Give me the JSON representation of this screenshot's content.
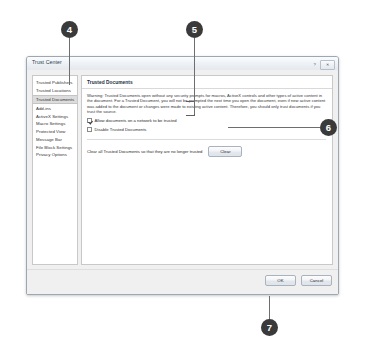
{
  "dialog": {
    "title": "Trust Center",
    "window_controls": [
      {
        "name": "help",
        "glyph": "?"
      },
      {
        "name": "close",
        "glyph": "✕"
      }
    ],
    "sidebar": {
      "items": [
        {
          "label": "Trusted Publishers",
          "selected": false
        },
        {
          "label": "Trusted Locations",
          "selected": false
        },
        {
          "label": "Trusted Documents",
          "selected": true
        },
        {
          "label": "Add-ins",
          "selected": false
        },
        {
          "label": "ActiveX Settings",
          "selected": false
        },
        {
          "label": "Macro Settings",
          "selected": false
        },
        {
          "label": "Protected View",
          "selected": false
        },
        {
          "label": "Message Bar",
          "selected": false
        },
        {
          "label": "File Block Settings",
          "selected": false
        },
        {
          "label": "Privacy Options",
          "selected": false
        }
      ]
    },
    "content": {
      "heading": "Trusted Documents",
      "warning": "Warning: Trusted Documents open without any security prompts for macros, ActiveX controls and other types of active content in the document. For a Trusted Document, you will not be prompted the next time you open the document, even if new active content was added to the document or changes were made to existing active content. Therefore, you should only trust documents if you trust the source.",
      "checkboxes": [
        {
          "label": "Allow documents on a network to be trusted",
          "checked": true,
          "accesskey": "A"
        },
        {
          "label": "Disable Trusted Documents",
          "checked": false,
          "accesskey": "D"
        }
      ],
      "clear_row": {
        "text": "Clear all Trusted Documents so that they are no longer trusted",
        "button_label": "Clear"
      }
    },
    "footer": {
      "ok_label": "OK",
      "cancel_label": "Cancel"
    }
  },
  "callouts": [
    {
      "number": "4",
      "target": "sidebar-item-trusted-documents"
    },
    {
      "number": "5",
      "target": "checkbox-group"
    },
    {
      "number": "6",
      "target": "clear-button"
    },
    {
      "number": "7",
      "target": "ok-button"
    }
  ]
}
